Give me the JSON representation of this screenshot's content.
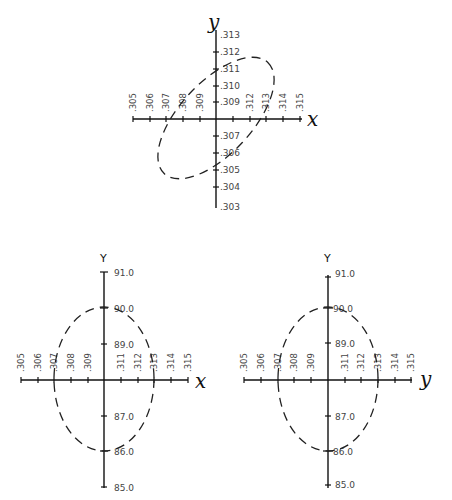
{
  "diagrams": [
    {
      "id": "top",
      "x_axis_name": "x",
      "y_axis_name": "y",
      "x_ticks": [
        ".305",
        ".306",
        ".307",
        ".308",
        ".309",
        ".311",
        ".312",
        ".313",
        ".314",
        ".315"
      ],
      "y_ticks": [
        ".313",
        ".312",
        ".311",
        ".310",
        ".309",
        ".307",
        ".306",
        ".305",
        ".304",
        ".303"
      ],
      "ellipse": "tilted dashed ellipse, major axis along positive diagonal"
    },
    {
      "id": "bottom-left",
      "x_axis_name": "x",
      "y_axis_name": "Y",
      "x_ticks": [
        ".305",
        ".306",
        ".307",
        ".308",
        ".309",
        ".311",
        ".312",
        ".313",
        ".314",
        ".315"
      ],
      "y_ticks": [
        "91.0",
        "90.0",
        "89.0",
        "87.0",
        "86.0",
        "85.0"
      ],
      "ellipse": "upright dashed ellipse centered on origin"
    },
    {
      "id": "bottom-right",
      "x_axis_name": "y",
      "y_axis_name": "Y",
      "x_ticks": [
        ".305",
        ".306",
        ".307",
        ".308",
        ".309",
        ".311",
        ".312",
        ".313",
        ".314",
        ".315"
      ],
      "y_ticks": [
        "91.0",
        "90.0",
        "89.0",
        "87.0",
        "86.0",
        "85.0"
      ],
      "ellipse": "upright dashed ellipse centered on origin"
    }
  ]
}
